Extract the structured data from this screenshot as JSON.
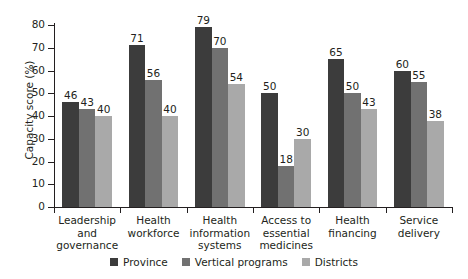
{
  "chart_data": {
    "type": "bar",
    "title": "",
    "subtitle": "",
    "xlabel": "",
    "ylabel": "Capacity score (%)",
    "ylim": [
      0,
      80
    ],
    "yticks": [
      0,
      10,
      20,
      30,
      40,
      50,
      60,
      70,
      80
    ],
    "grid": false,
    "legend_position": "bottom-center",
    "categories": [
      "Leadership and governance",
      "Health workforce",
      "Health information systems",
      "Access to essential medicines",
      "Health financing",
      "Service delivery"
    ],
    "series": [
      {
        "name": "Province",
        "color": "#3c3c3c",
        "values": [
          46,
          71,
          79,
          50,
          65,
          60
        ]
      },
      {
        "name": "Vertical programs",
        "color": "#717171",
        "values": [
          43,
          56,
          70,
          18,
          50,
          55
        ]
      },
      {
        "name": "Districts",
        "color": "#a9a9a9",
        "values": [
          40,
          40,
          54,
          30,
          43,
          38
        ]
      }
    ]
  },
  "axis": {
    "y_title": "Capacity score (%)",
    "tick_labels": [
      "80",
      "70",
      "60",
      "50",
      "40",
      "30",
      "20",
      "10",
      "0"
    ]
  },
  "category_labels": [
    [
      "Leadership and",
      "governance"
    ],
    [
      "Health",
      "workforce"
    ],
    [
      "Health",
      "information",
      "systems"
    ],
    [
      "Access to",
      "essential",
      "medicines"
    ],
    [
      "Health",
      "financing"
    ],
    [
      "Service",
      "delivery"
    ]
  ],
  "legend": {
    "items": [
      {
        "label": "Province",
        "color": "#3c3c3c"
      },
      {
        "label": "Vertical programs",
        "color": "#717171"
      },
      {
        "label": "Districts",
        "color": "#a9a9a9"
      }
    ]
  }
}
